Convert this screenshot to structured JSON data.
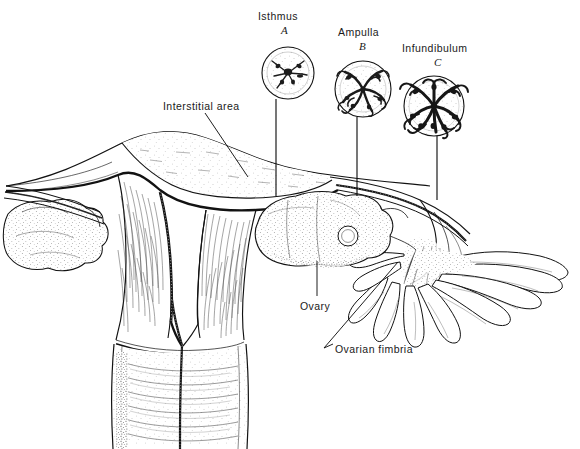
{
  "figure": {
    "background_color": "#ffffff",
    "ink_color": "#121212",
    "style": "pen-and-ink anatomical line drawing with stipple shading"
  },
  "insets": [
    {
      "id": "A",
      "label": "Isthmus",
      "letter": "A",
      "label_x": 258,
      "label_y": 10,
      "letter_x": 281,
      "letter_y": 26,
      "cx": 288,
      "cy": 73,
      "r": 26,
      "lumen": "narrow star-shaped lumen, few thick mucosal folds",
      "leader_x": 276,
      "leader_y1": 99,
      "leader_y2": 196
    },
    {
      "id": "B",
      "label": "Ampulla",
      "letter": "B",
      "label_x": 338,
      "label_y": 26,
      "letter_x": 359,
      "letter_y": 42,
      "cx": 363,
      "cy": 89,
      "r": 28,
      "lumen": "branching labyrinthine lumen, many mucosal folds",
      "leader_x": 357,
      "leader_y1": 117,
      "leader_y2": 196
    },
    {
      "id": "C",
      "label": "Infundibulum",
      "letter": "C",
      "label_x": 402,
      "label_y": 42,
      "letter_x": 434,
      "letter_y": 58,
      "cx": 434,
      "cy": 106,
      "r": 30,
      "lumen": "densely folded rosette lumen, most elaborate folds",
      "leader_x": 437,
      "leader_y1": 136,
      "leader_y2": 200
    }
  ],
  "callouts": [
    {
      "name": "interstitial-area",
      "text": "Interstitial area",
      "label_x": 163,
      "label_y": 100,
      "line_x1": 205,
      "line_y1": 113,
      "line_x2": 248,
      "line_y2": 177
    },
    {
      "name": "ovary",
      "text": "Ovary",
      "label_x": 300,
      "label_y": 300,
      "line_x1": 317,
      "line_y1": 296,
      "line_x2": 317,
      "line_y2": 261
    },
    {
      "name": "ovarian-fimbria",
      "text": "Ovarian fimbria",
      "label_x": 331,
      "label_y": 343,
      "line_x1": 324,
      "line_y1": 348,
      "line_x2": 398,
      "line_y2": 262
    }
  ],
  "structures": [
    {
      "name": "uterine-fundus",
      "description": "stippled dome of uterine body at top center-left"
    },
    {
      "name": "endometrial-cavity",
      "description": "dark triangular cavity lining inside uterus"
    },
    {
      "name": "myometrium",
      "description": "fibrous striated uterine wall"
    },
    {
      "name": "cervix",
      "description": "lower uterine segment with horizontal rugae"
    },
    {
      "name": "cervical-canal",
      "description": "beaded central canal through cervix"
    },
    {
      "name": "left-ovary",
      "description": "lumpy stippled ovoid at far left"
    },
    {
      "name": "right-ovary",
      "description": "lumpy stippled ovoid at center right with follicle"
    },
    {
      "name": "ovarian-follicle",
      "description": "small round follicle on right ovary"
    },
    {
      "name": "left-fallopian-tube",
      "description": "tube extending left from uterus"
    },
    {
      "name": "right-fallopian-tube",
      "description": "tube curving right from uterus to fimbriae"
    },
    {
      "name": "fimbriae",
      "description": "finger-like projections at right tube end"
    }
  ]
}
